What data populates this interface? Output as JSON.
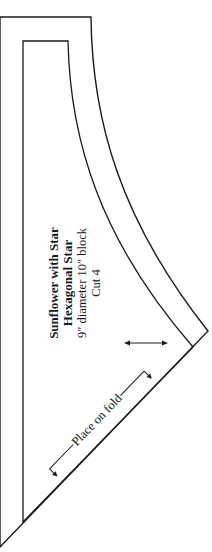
{
  "pattern": {
    "title": "Sunflower with Star",
    "subtitle": "Hexagonal Star",
    "size": "9″ diameter 10″ block",
    "cut": "Cut 4",
    "fold_label": "Place on fold"
  },
  "colors": {
    "line": "#1a1a1a",
    "background": "#ffffff"
  }
}
